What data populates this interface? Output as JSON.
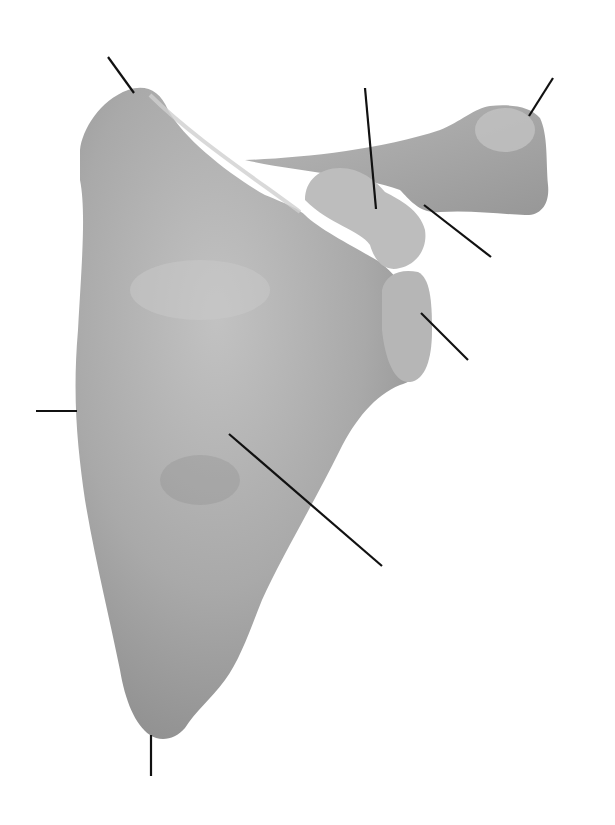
{
  "diagram": {
    "view": "posterior",
    "background": "#ffffff",
    "bone_color": "#a8a8a8",
    "bone_highlight": "#c4c4c4",
    "bone_shadow": "#8a8a8a",
    "line_color": "#111111",
    "labels": [],
    "leader_lines": [
      {
        "id": "superior-angle",
        "x1": 108,
        "y1": 57,
        "x2": 134,
        "y2": 93
      },
      {
        "id": "coracoid-process",
        "x1": 365,
        "y1": 88,
        "x2": 376,
        "y2": 209
      },
      {
        "id": "acromion",
        "x1": 553,
        "y1": 78,
        "x2": 529,
        "y2": 116
      },
      {
        "id": "glenoid-neck",
        "x1": 424,
        "y1": 205,
        "x2": 491,
        "y2": 257
      },
      {
        "id": "glenoid-cavity",
        "x1": 421,
        "y1": 313,
        "x2": 468,
        "y2": 360
      },
      {
        "id": "medial-border",
        "x1": 36,
        "y1": 411,
        "x2": 77,
        "y2": 411
      },
      {
        "id": "subscapular-fossa",
        "x1": 229,
        "y1": 434,
        "x2": 382,
        "y2": 566
      },
      {
        "id": "inferior-angle",
        "x1": 151,
        "y1": 735,
        "x2": 151,
        "y2": 776
      }
    ]
  }
}
